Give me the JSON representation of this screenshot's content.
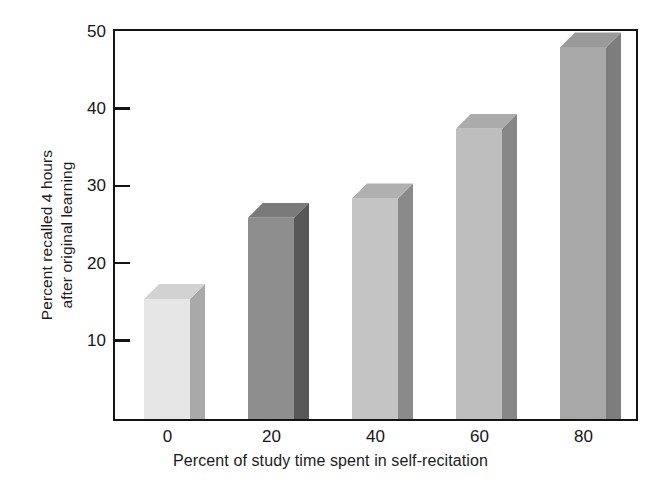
{
  "chart_data": {
    "type": "bar",
    "title": "",
    "xlabel": "Percent of study time spent in self-recitation",
    "ylabel_line1": "Percent recalled 4 hours",
    "ylabel_line2": "after original learning",
    "categories": [
      "0",
      "20",
      "40",
      "60",
      "80"
    ],
    "values": [
      15.5,
      26,
      28.5,
      37.5,
      48
    ],
    "xlim": [
      -10,
      90
    ],
    "ylim": [
      0,
      50
    ],
    "yticks": [
      10,
      20,
      30,
      40,
      50
    ],
    "ytick_labels": [
      "10",
      "20",
      "30",
      "40",
      "50"
    ],
    "xticks": [
      0,
      20,
      40,
      60,
      80
    ],
    "xtick_labels": [
      "0",
      "20",
      "40",
      "60",
      "80"
    ],
    "grid": false,
    "legend": false,
    "style": "3d-bars-grayscale",
    "bars": [
      {
        "category": "0",
        "value": 15.5,
        "front_color": "#e6e6e6",
        "side_color": "#a9a9a9",
        "top_color": "#d2d2d2"
      },
      {
        "category": "20",
        "value": 26.0,
        "front_color": "#8e8e8e",
        "side_color": "#575757",
        "top_color": "#7a7a7a"
      },
      {
        "category": "40",
        "value": 28.5,
        "front_color": "#c4c4c4",
        "side_color": "#8a8a8a",
        "top_color": "#b0b0b0"
      },
      {
        "category": "60",
        "value": 37.5,
        "front_color": "#bebebe",
        "side_color": "#878787",
        "top_color": "#ababab"
      },
      {
        "category": "80",
        "value": 48.0,
        "front_color": "#a8a8a8",
        "side_color": "#7d7d7d",
        "top_color": "#9a9a9a"
      }
    ],
    "axis_color": "#141414",
    "text_color": "#161616",
    "background_color": "#ffffff"
  }
}
